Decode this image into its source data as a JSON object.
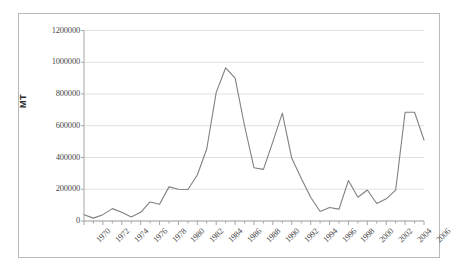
{
  "chart_data": {
    "type": "line",
    "title": "",
    "xlabel": "",
    "ylabel": "MT",
    "x": [
      1970,
      1971,
      1972,
      1973,
      1974,
      1975,
      1976,
      1977,
      1978,
      1979,
      1980,
      1981,
      1982,
      1983,
      1984,
      1985,
      1986,
      1987,
      1988,
      1989,
      1990,
      1991,
      1992,
      1993,
      1994,
      1995,
      1996,
      1997,
      1998,
      1999,
      2000,
      2001,
      2002,
      2003,
      2004,
      2005,
      2006
    ],
    "values": [
      40000,
      18000,
      40000,
      78000,
      55000,
      25000,
      55000,
      120000,
      105000,
      215000,
      200000,
      198000,
      290000,
      455000,
      810000,
      965000,
      900000,
      600000,
      335000,
      325000,
      500000,
      680000,
      395000,
      270000,
      150000,
      60000,
      85000,
      75000,
      255000,
      150000,
      195000,
      110000,
      140000,
      195000,
      685000,
      685000,
      510000
    ],
    "series": [
      {
        "name": "MT",
        "color": "#808080",
        "values": [
          40000,
          18000,
          40000,
          78000,
          55000,
          25000,
          55000,
          120000,
          105000,
          215000,
          200000,
          198000,
          290000,
          455000,
          810000,
          965000,
          900000,
          600000,
          335000,
          325000,
          500000,
          680000,
          395000,
          270000,
          150000,
          60000,
          85000,
          75000,
          255000,
          150000,
          195000,
          110000,
          140000,
          195000,
          685000,
          685000,
          510000
        ]
      }
    ],
    "xlim": [
      1970,
      2006
    ],
    "ylim": [
      0,
      1200000
    ],
    "yticks": [
      0,
      200000,
      400000,
      600000,
      800000,
      1000000,
      1200000
    ],
    "ytick_labels": [
      "0",
      "200000",
      "400000",
      "600000",
      "800000",
      "1000000",
      "1200000"
    ],
    "xticks": [
      1970,
      1972,
      1974,
      1976,
      1978,
      1980,
      1982,
      1984,
      1986,
      1988,
      1990,
      1992,
      1994,
      1996,
      1998,
      2000,
      2002,
      2004,
      2006
    ],
    "xtick_labels": [
      "1970",
      "1972",
      "1974",
      "1976",
      "1978",
      "1980",
      "1982",
      "1984",
      "1986",
      "1988",
      "1990",
      "1992",
      "1994",
      "1996",
      "1998",
      "2000",
      "2002",
      "2004",
      "2006"
    ],
    "xtick_minor": [
      1971,
      1973,
      1975,
      1977,
      1979,
      1981,
      1983,
      1985,
      1987,
      1989,
      1991,
      1993,
      1995,
      1997,
      1999,
      2001,
      2003,
      2005
    ],
    "grid": {
      "horizontal": true,
      "vertical": false,
      "color": "#d9d9d9"
    },
    "legend": {
      "visible": false,
      "position": "none"
    },
    "colors": {
      "line": "#808080",
      "axis": "#a6a6a6",
      "grid": "#d9d9d9",
      "text": "#4a4a4a",
      "frame": "#b9b9b9",
      "background": "#ffffff"
    }
  }
}
